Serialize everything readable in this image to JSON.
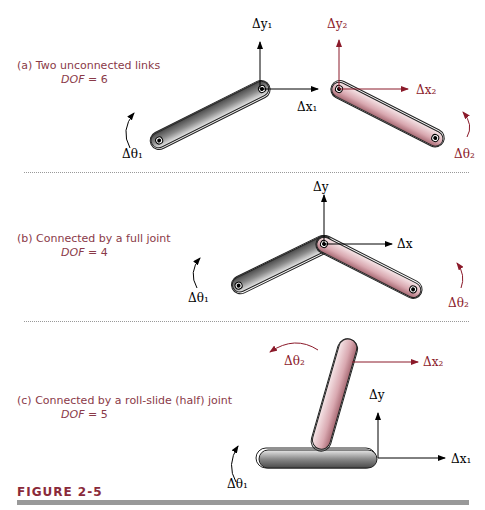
{
  "panels": [
    {
      "label": "(a)",
      "caption": "Two unconnected links",
      "dof_label": "DOF",
      "dof_eq": " = 6"
    },
    {
      "label": "(b)",
      "caption": "Connected by a full joint",
      "dof_label": "DOF",
      "dof_eq": " = 4"
    },
    {
      "label": "(c)",
      "caption": "Connected by a roll-slide (half) joint",
      "dof_label": "DOF",
      "dof_eq": " = 5"
    }
  ],
  "annotations": {
    "a": {
      "dy1": "Δy₁",
      "dx1": "Δx₁",
      "dy2": "Δy₂",
      "dx2": "Δx₂",
      "dt1": "Δθ₁",
      "dt2": "Δθ₂"
    },
    "b": {
      "dy": "Δy",
      "dx": "Δx",
      "dt1": "Δθ₁",
      "dt2": "Δθ₂"
    },
    "c": {
      "dt2": "Δθ₂",
      "dx2": "Δx₂",
      "dy": "Δy",
      "dx1": "Δx₁",
      "dt1": "Δθ₁"
    }
  },
  "figure": {
    "label": "FIGURE 2-5"
  },
  "colors": {
    "caption": "#8a3a48",
    "red": "#8b1a2a",
    "gray_link": "#777777",
    "pink_link": "#d8aab0"
  }
}
